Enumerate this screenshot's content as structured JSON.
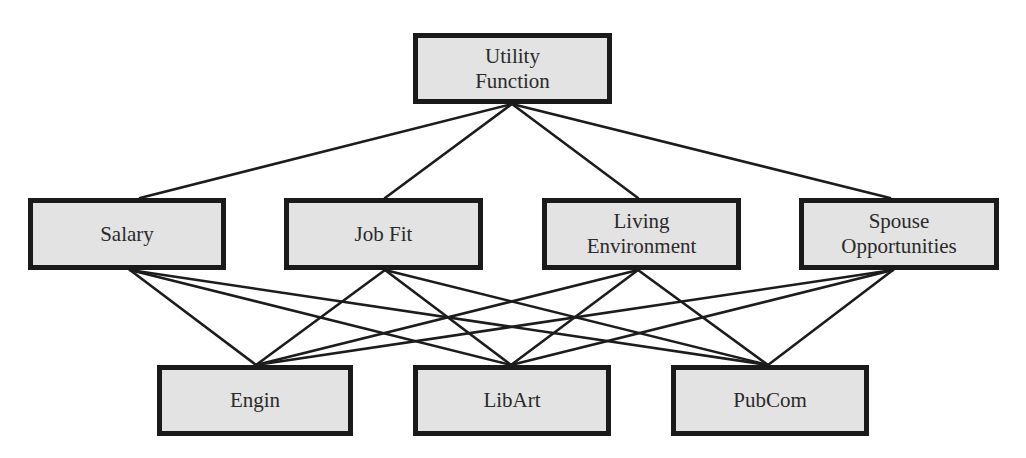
{
  "diagram": {
    "type": "hierarchy",
    "style": {
      "node_fill": "#e3e3e3",
      "node_border": "#1a1a1a",
      "edge_color": "#1c1c1c",
      "text_color": "#2a2a2a"
    },
    "goal": {
      "id": "utility",
      "lines": [
        "Utility",
        "Function"
      ],
      "box": {
        "x": 413,
        "y": 33,
        "w": 199,
        "h": 71
      }
    },
    "criteria": [
      {
        "id": "salary",
        "lines": [
          "Salary"
        ],
        "box": {
          "x": 28,
          "y": 198,
          "w": 198,
          "h": 72
        },
        "top": [
          140,
          198
        ],
        "bottom": [
          130,
          270
        ]
      },
      {
        "id": "jobfit",
        "lines": [
          "Job Fit"
        ],
        "box": {
          "x": 284,
          "y": 198,
          "w": 199,
          "h": 72
        },
        "top": [
          385,
          198
        ],
        "bottom": [
          385,
          270
        ]
      },
      {
        "id": "living",
        "lines": [
          "Living",
          "Environment"
        ],
        "box": {
          "x": 542,
          "y": 198,
          "w": 199,
          "h": 72
        },
        "top": [
          638,
          198
        ],
        "bottom": [
          638,
          270
        ]
      },
      {
        "id": "spouse",
        "lines": [
          "Spouse",
          "Opportunities"
        ],
        "box": {
          "x": 799,
          "y": 198,
          "w": 200,
          "h": 72
        },
        "top": [
          890,
          198
        ],
        "bottom": [
          893,
          270
        ]
      }
    ],
    "alternatives": [
      {
        "id": "engin",
        "lines": [
          "Engin"
        ],
        "box": {
          "x": 157,
          "y": 365,
          "w": 196,
          "h": 71
        },
        "top": [
          256,
          365
        ]
      },
      {
        "id": "libart",
        "lines": [
          "LibArt"
        ],
        "box": {
          "x": 413,
          "y": 365,
          "w": 198,
          "h": 71
        },
        "top": [
          511,
          365
        ]
      },
      {
        "id": "pubcom",
        "lines": [
          "PubCom"
        ],
        "box": {
          "x": 671,
          "y": 365,
          "w": 198,
          "h": 71
        },
        "top": [
          768,
          365
        ]
      }
    ],
    "goal_anchor": [
      512,
      104
    ],
    "edges": {
      "goal_to_criteria": [
        "salary",
        "jobfit",
        "living",
        "spouse"
      ],
      "criteria_to_alternatives": [
        [
          "salary",
          "engin"
        ],
        [
          "salary",
          "libart"
        ],
        [
          "salary",
          "pubcom"
        ],
        [
          "jobfit",
          "engin"
        ],
        [
          "jobfit",
          "libart"
        ],
        [
          "jobfit",
          "pubcom"
        ],
        [
          "living",
          "engin"
        ],
        [
          "living",
          "libart"
        ],
        [
          "living",
          "pubcom"
        ],
        [
          "spouse",
          "engin"
        ],
        [
          "spouse",
          "libart"
        ],
        [
          "spouse",
          "pubcom"
        ]
      ]
    }
  }
}
